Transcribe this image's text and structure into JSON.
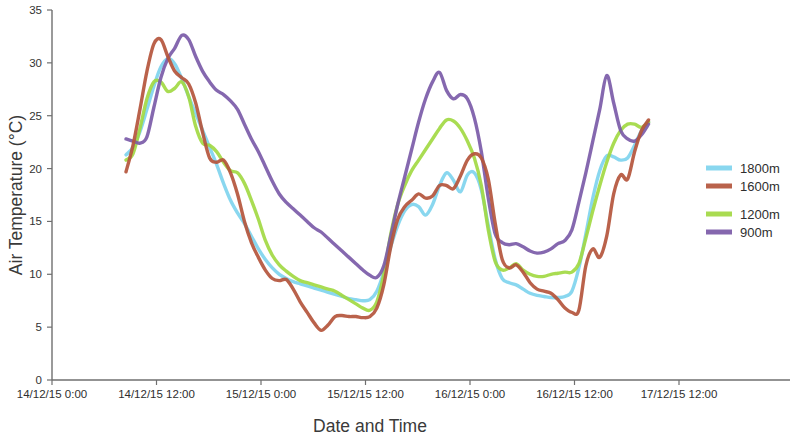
{
  "chart_data": {
    "type": "line",
    "title": "",
    "xlabel": "Date and Time",
    "ylabel": "Air Temperature (°C)",
    "ylim": [
      0,
      35
    ],
    "ytick_step": 5,
    "yticks": [
      "0",
      "5",
      "10",
      "15",
      "20",
      "25",
      "30",
      "35"
    ],
    "xticks": [
      "14/12/15 0:00",
      "14/12/15 12:00",
      "15/12/15 0:00",
      "15/12/15 12:00",
      "16/12/15 0:00",
      "16/12/15 12:00",
      "17/12/15 12:00"
    ],
    "xlim_hours": [
      0,
      72
    ],
    "grid": false,
    "legend_position": "right",
    "legend": [
      "1800m",
      "1600m",
      "1200m",
      "900m"
    ],
    "colors": {
      "1800m": "#7FD4EE",
      "1600m": "#B4553C",
      "1200m": "#A2D943",
      "900m": "#7B5BA8"
    },
    "x_hours": [
      8.5,
      9.3,
      10.1,
      10.9,
      11.7,
      12.5,
      13.3,
      14.1,
      14.9,
      15.7,
      16.5,
      17.3,
      18.1,
      18.9,
      19.7,
      20.5,
      21.3,
      22.1,
      22.9,
      23.7,
      24.5,
      25.3,
      26.1,
      26.9,
      27.7,
      28.5,
      29.3,
      30.1,
      30.9,
      31.7,
      32.5,
      33.3,
      34.1,
      34.9,
      35.7,
      36.5,
      37.3,
      38.1,
      38.9,
      39.7,
      40.5,
      41.3,
      42.1,
      42.9,
      43.7,
      44.5,
      45.3,
      46.1,
      46.9,
      47.7,
      48.5,
      49.3,
      50.1,
      50.9,
      51.7,
      52.5,
      53.3,
      54.1,
      54.9,
      55.7,
      56.5,
      57.3,
      58.1,
      58.9,
      59.7,
      60.5,
      61.3,
      62.1,
      62.9,
      63.7,
      64.5,
      65.3,
      66.1,
      66.9,
      67.7,
      68.5
    ],
    "series": [
      {
        "name": "1800m",
        "color": "#7FD4EE",
        "values": [
          21.3,
          22.0,
          23.5,
          25.6,
          27.8,
          29.6,
          30.4,
          29.9,
          28.5,
          26.8,
          25.2,
          23.6,
          22.0,
          20.4,
          18.6,
          17.0,
          15.8,
          14.8,
          13.6,
          12.4,
          11.4,
          10.6,
          10.0,
          9.6,
          9.3,
          9.1,
          8.9,
          8.7,
          8.5,
          8.3,
          8.1,
          7.9,
          7.7,
          7.6,
          7.5,
          7.6,
          8.4,
          10.2,
          12.6,
          14.6,
          16.0,
          16.6,
          16.4,
          15.6,
          16.6,
          18.4,
          19.6,
          18.9,
          17.8,
          19.4,
          19.6,
          18.0,
          14.6,
          11.4,
          9.6,
          9.2,
          9.0,
          8.6,
          8.2,
          8.0,
          7.9,
          7.8,
          7.8,
          7.9,
          8.4,
          10.6,
          13.8,
          17.2,
          19.8,
          21.2,
          21.1,
          20.8,
          21.0,
          22.2,
          23.6,
          24.4
        ]
      },
      {
        "name": "1600m",
        "color": "#B4553C",
        "values": [
          19.7,
          22.2,
          25.6,
          29.2,
          31.8,
          32.2,
          30.6,
          29.2,
          28.6,
          28.0,
          26.2,
          23.4,
          21.0,
          20.6,
          20.8,
          19.6,
          17.6,
          15.0,
          13.0,
          11.6,
          10.4,
          9.6,
          9.4,
          9.5,
          8.6,
          7.4,
          6.4,
          5.4,
          4.7,
          5.2,
          6.0,
          6.1,
          6.0,
          6.0,
          5.9,
          6.0,
          6.8,
          9.0,
          12.6,
          15.2,
          16.4,
          17.0,
          17.6,
          17.2,
          17.4,
          18.4,
          18.4,
          18.1,
          19.3,
          20.8,
          21.4,
          21.0,
          19.0,
          14.8,
          11.4,
          10.6,
          10.9,
          10.2,
          9.2,
          8.6,
          8.4,
          8.2,
          7.6,
          6.8,
          6.4,
          6.6,
          10.8,
          12.4,
          11.6,
          13.6,
          17.6,
          19.4,
          19.0,
          21.6,
          23.6,
          24.6
        ]
      },
      {
        "name": "1200m",
        "color": "#A2D943",
        "values": [
          20.8,
          21.4,
          23.8,
          26.6,
          28.2,
          28.2,
          27.3,
          27.6,
          28.2,
          26.8,
          24.0,
          22.4,
          22.2,
          21.6,
          20.6,
          19.8,
          19.6,
          18.6,
          17.0,
          15.2,
          13.2,
          11.8,
          10.9,
          10.3,
          9.8,
          9.4,
          9.2,
          9.0,
          8.8,
          8.6,
          8.4,
          8.0,
          7.6,
          7.2,
          6.8,
          6.6,
          7.4,
          10.0,
          13.8,
          16.6,
          18.4,
          19.8,
          20.8,
          21.8,
          22.8,
          23.8,
          24.6,
          24.5,
          23.8,
          22.6,
          21.0,
          18.4,
          14.2,
          11.2,
          10.4,
          10.6,
          11.0,
          10.4,
          10.0,
          9.8,
          9.8,
          10.0,
          10.1,
          10.2,
          10.2,
          11.0,
          13.4,
          16.0,
          18.4,
          20.6,
          22.4,
          23.6,
          24.2,
          24.2,
          23.9,
          24.4
        ]
      },
      {
        "name": "900m",
        "color": "#7B5BA8",
        "values": [
          22.8,
          22.6,
          22.4,
          23.0,
          25.8,
          28.6,
          30.4,
          31.4,
          32.6,
          32.2,
          30.6,
          29.2,
          28.2,
          27.4,
          27.0,
          26.4,
          25.6,
          24.2,
          22.8,
          21.6,
          20.2,
          18.8,
          17.6,
          16.8,
          16.2,
          15.6,
          15.0,
          14.4,
          14.0,
          13.4,
          12.8,
          12.2,
          11.6,
          11.0,
          10.4,
          9.9,
          9.7,
          10.8,
          13.6,
          16.6,
          19.2,
          21.8,
          24.4,
          26.6,
          28.2,
          29.1,
          27.4,
          26.6,
          27.0,
          26.6,
          24.8,
          21.6,
          17.2,
          13.8,
          13.0,
          12.8,
          12.9,
          12.6,
          12.2,
          12.0,
          12.1,
          12.4,
          12.9,
          13.2,
          14.2,
          16.8,
          19.6,
          22.6,
          25.6,
          28.8,
          26.2,
          23.6,
          22.8,
          22.6,
          23.2,
          24.2
        ]
      }
    ]
  },
  "legend": {
    "items": [
      {
        "label": "1800m",
        "color": "#7FD4EE"
      },
      {
        "label": "1600m",
        "color": "#B4553C"
      },
      {
        "label": "1200m",
        "color": "#A2D943"
      },
      {
        "label": "900m",
        "color": "#7B5BA8"
      }
    ]
  }
}
